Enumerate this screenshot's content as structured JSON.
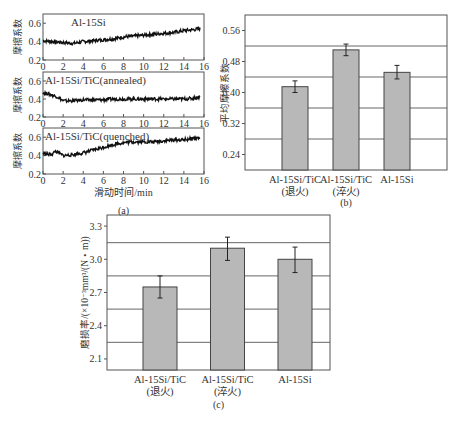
{
  "chart_data": [
    {
      "id": "a",
      "type": "line",
      "caption": "(a)",
      "xlabel": "滑动时间/min",
      "ylabel": "摩擦系数",
      "xlim": [
        0,
        16
      ],
      "ylim": [
        0.2,
        0.7
      ],
      "xticks": [
        "0",
        "2",
        "4",
        "6",
        "8",
        "10",
        "12",
        "14",
        "16"
      ],
      "yticks": [
        "0.2",
        "0.4",
        "0.6"
      ],
      "grid": false,
      "subplots": [
        {
          "title": "Al-15Si",
          "x": [
            0,
            1,
            2,
            3,
            4,
            5,
            6,
            7,
            8,
            9,
            10,
            11,
            12,
            13,
            14,
            15,
            15.6
          ],
          "y": [
            0.41,
            0.4,
            0.39,
            0.38,
            0.4,
            0.41,
            0.42,
            0.43,
            0.45,
            0.46,
            0.47,
            0.48,
            0.49,
            0.5,
            0.52,
            0.53,
            0.54
          ]
        },
        {
          "title": "Al-15Si/TiC(annealed)",
          "x": [
            0,
            0.5,
            1,
            1.5,
            2,
            3,
            4,
            5,
            6,
            7,
            8,
            9,
            10,
            11,
            12,
            13,
            14,
            15,
            15.6
          ],
          "y": [
            0.47,
            0.46,
            0.44,
            0.42,
            0.38,
            0.38,
            0.39,
            0.39,
            0.39,
            0.4,
            0.4,
            0.4,
            0.4,
            0.4,
            0.4,
            0.4,
            0.4,
            0.41,
            0.42
          ]
        },
        {
          "title": "Al-15Si/TiC(quenched)",
          "x": [
            0,
            0.5,
            1,
            1.2,
            2,
            3,
            4,
            5,
            6,
            7,
            8,
            9,
            10,
            11,
            12,
            13,
            14,
            15,
            15.6
          ],
          "y": [
            0.43,
            0.41,
            0.42,
            0.45,
            0.4,
            0.41,
            0.43,
            0.46,
            0.49,
            0.52,
            0.54,
            0.55,
            0.55,
            0.55,
            0.56,
            0.57,
            0.57,
            0.59,
            0.59
          ]
        }
      ]
    },
    {
      "id": "b",
      "type": "bar",
      "caption": "(b)",
      "ylabel": "平均摩擦系数",
      "xlabel": "",
      "ylim": [
        0.2,
        0.6
      ],
      "yticks": [
        "0.24",
        "0.32",
        "0.40",
        "0.48",
        "0.56"
      ],
      "gridlines": [
        0.28,
        0.36,
        0.44,
        0.52
      ],
      "categories": [
        [
          "Al-15Si/TiC",
          "(退火)"
        ],
        [
          "Al-15Si/TiC",
          "(淬火)"
        ],
        [
          "Al-15Si",
          ""
        ]
      ],
      "values": [
        0.415,
        0.51,
        0.452
      ],
      "errors": [
        [
          0.4,
          0.43
        ],
        [
          0.495,
          0.525
        ],
        [
          0.435,
          0.47
        ]
      ],
      "bar_color": "#b8b8b8"
    },
    {
      "id": "c",
      "type": "bar",
      "caption": "(c)",
      "ylabel": "磨损率/(×10⁻³mm³/(N・m))",
      "xlabel": "",
      "ylim": [
        2.0,
        3.4
      ],
      "yticks": [
        "2.1",
        "2.4",
        "2.7",
        "3.0",
        "3.3"
      ],
      "gridlines": [
        2.25,
        2.55,
        2.85,
        3.15
      ],
      "categories": [
        [
          "Al-15Si/TiC",
          "(退火)"
        ],
        [
          "Al-15Si/TiC",
          "(淬火)"
        ],
        [
          "Al-15Si",
          ""
        ]
      ],
      "values": [
        2.75,
        3.1,
        3.0
      ],
      "errors": [
        [
          2.65,
          2.85
        ],
        [
          2.99,
          3.2
        ],
        [
          2.88,
          3.11
        ]
      ],
      "bar_color": "#b8b8b8"
    }
  ]
}
